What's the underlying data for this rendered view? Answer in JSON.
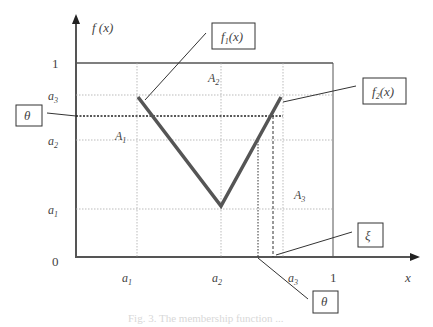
{
  "diagram": {
    "y_axis_label": "f (x)",
    "x_axis_label": "x",
    "y_ticks": [
      {
        "label": "1",
        "y": 63
      },
      {
        "label": "a3",
        "y": 95
      },
      {
        "label": "a2",
        "y": 140
      },
      {
        "label": "a1",
        "y": 209
      },
      {
        "label": "0",
        "y": 257
      }
    ],
    "x_ticks": [
      {
        "label": "a1",
        "x": 137
      },
      {
        "label": "a2",
        "x": 221
      },
      {
        "label": "a3",
        "x": 283
      },
      {
        "label": "1",
        "x": 333
      }
    ],
    "regions": {
      "A1": "A1",
      "A2": "A2",
      "A3": "A3"
    },
    "callouts": {
      "f1": "f1(x)",
      "f2": "f2(x)",
      "theta_left": "θ",
      "xi": "ξ",
      "theta_bottom": "θ"
    }
  },
  "caption": "Fig. 3. The membership function ..."
}
